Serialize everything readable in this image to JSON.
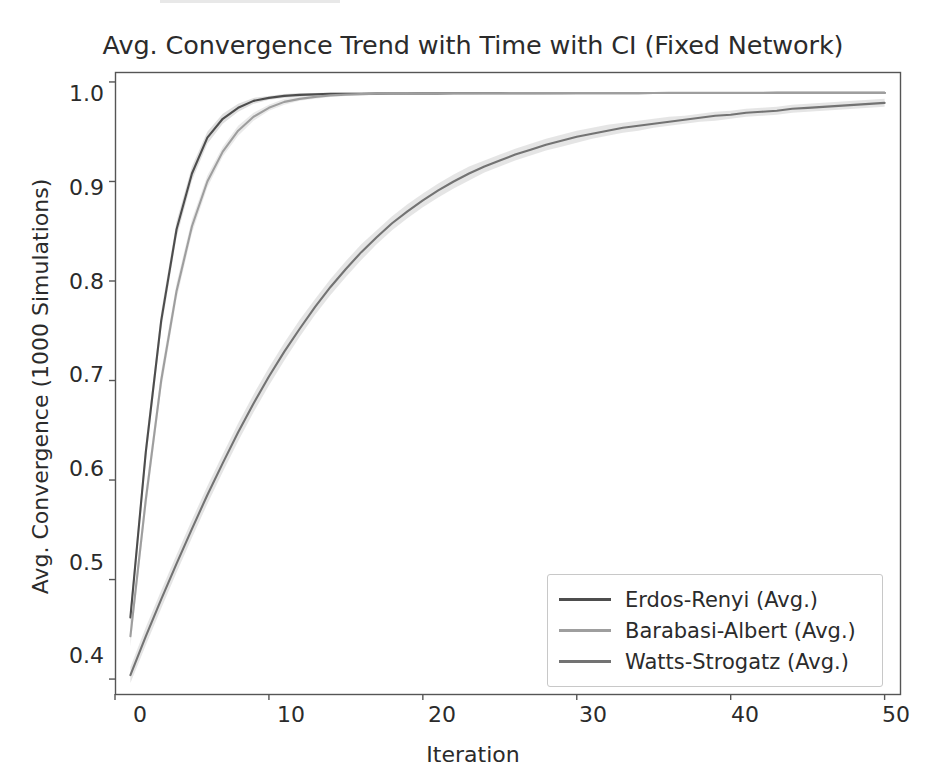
{
  "figure": {
    "background": "#ffffff",
    "width": 946,
    "height": 780
  },
  "chart_data": {
    "type": "line",
    "title": "Avg. Convergence Trend with Time with CI (Fixed Network)",
    "xlabel": "Iteration",
    "ylabel": "Avg. Convergence (1000 Simulations)",
    "xlim": [
      0,
      51
    ],
    "ylim": [
      0.385,
      1.01
    ],
    "grid": false,
    "legend_position": "lower right",
    "xticks": [
      0,
      10,
      20,
      30,
      40,
      50
    ],
    "xtick_labels": [
      "0",
      "10",
      "20",
      "30",
      "40",
      "50"
    ],
    "yticks": [
      0.4,
      0.5,
      0.6,
      0.7,
      0.8,
      0.9,
      1.0
    ],
    "ytick_labels": [
      "0.4",
      "0.5",
      "0.6",
      "0.7",
      "0.8",
      "0.9",
      "1.0"
    ],
    "x": [
      1,
      2,
      3,
      4,
      5,
      6,
      7,
      8,
      9,
      10,
      11,
      12,
      13,
      14,
      15,
      16,
      17,
      18,
      19,
      20,
      21,
      22,
      23,
      24,
      25,
      26,
      27,
      28,
      29,
      30,
      31,
      32,
      33,
      34,
      35,
      36,
      37,
      38,
      39,
      40,
      41,
      42,
      43,
      44,
      45,
      46,
      47,
      48,
      49,
      50
    ],
    "series": [
      {
        "name": "Erdos-Renyi (Avg.)",
        "color": "#4d4d4d",
        "ci_color": "#d9d9d9",
        "values": [
          0.462,
          0.628,
          0.76,
          0.852,
          0.908,
          0.944,
          0.963,
          0.974,
          0.981,
          0.984,
          0.986,
          0.987,
          0.9875,
          0.988,
          0.988,
          0.9882,
          0.9883,
          0.9884,
          0.9884,
          0.9885,
          0.9885,
          0.9886,
          0.9886,
          0.9886,
          0.9887,
          0.9887,
          0.9887,
          0.9887,
          0.9888,
          0.9888,
          0.9888,
          0.9888,
          0.9888,
          0.9888,
          0.9889,
          0.9889,
          0.9889,
          0.9889,
          0.9889,
          0.9889,
          0.9889,
          0.9889,
          0.989,
          0.989,
          0.989,
          0.989,
          0.989,
          0.989,
          0.989,
          0.989
        ],
        "ci_lower": [
          0.452,
          0.618,
          0.751,
          0.844,
          0.901,
          0.938,
          0.958,
          0.97,
          0.978,
          0.982,
          0.984,
          0.985,
          0.986,
          0.9865,
          0.9868,
          0.987,
          0.9871,
          0.9872,
          0.9873,
          0.9874,
          0.9874,
          0.9875,
          0.9875,
          0.9876,
          0.9876,
          0.9877,
          0.9877,
          0.9877,
          0.9878,
          0.9878,
          0.9878,
          0.9878,
          0.9879,
          0.9879,
          0.9879,
          0.9879,
          0.9879,
          0.988,
          0.988,
          0.988,
          0.988,
          0.988,
          0.988,
          0.988,
          0.988,
          0.988,
          0.988,
          0.988,
          0.988,
          0.988
        ],
        "ci_upper": [
          0.472,
          0.638,
          0.769,
          0.86,
          0.915,
          0.95,
          0.968,
          0.978,
          0.984,
          0.986,
          0.988,
          0.989,
          0.989,
          0.9895,
          0.9896,
          0.9897,
          0.9898,
          0.9898,
          0.9899,
          0.9899,
          0.99,
          0.99,
          0.99,
          0.99,
          0.99,
          0.99,
          0.99,
          0.99,
          0.99,
          0.99,
          0.99,
          0.99,
          0.99,
          0.99,
          0.99,
          0.99,
          0.99,
          0.99,
          0.99,
          0.99,
          0.99,
          0.99,
          0.99,
          0.99,
          0.99,
          0.99,
          0.99,
          0.99,
          0.99,
          0.99
        ]
      },
      {
        "name": "Barabasi-Albert (Avg.)",
        "color": "#9e9e9e",
        "ci_color": "#e6e6e6",
        "values": [
          0.443,
          0.58,
          0.7,
          0.79,
          0.855,
          0.9,
          0.93,
          0.951,
          0.965,
          0.974,
          0.98,
          0.983,
          0.985,
          0.9865,
          0.9873,
          0.9878,
          0.9881,
          0.9883,
          0.9884,
          0.9885,
          0.9886,
          0.9886,
          0.9887,
          0.9887,
          0.9887,
          0.9888,
          0.9888,
          0.9888,
          0.9888,
          0.9889,
          0.9889,
          0.9889,
          0.9889,
          0.9889,
          0.9889,
          0.989,
          0.989,
          0.989,
          0.989,
          0.989,
          0.989,
          0.989,
          0.989,
          0.989,
          0.989,
          0.989,
          0.989,
          0.989,
          0.989,
          0.989
        ],
        "ci_lower": [
          0.433,
          0.57,
          0.691,
          0.782,
          0.848,
          0.894,
          0.925,
          0.946,
          0.961,
          0.971,
          0.977,
          0.981,
          0.983,
          0.985,
          0.986,
          0.9865,
          0.9869,
          0.9871,
          0.9873,
          0.9874,
          0.9875,
          0.9875,
          0.9876,
          0.9876,
          0.9877,
          0.9877,
          0.9877,
          0.9878,
          0.9878,
          0.9878,
          0.9878,
          0.9879,
          0.9879,
          0.9879,
          0.9879,
          0.988,
          0.988,
          0.988,
          0.988,
          0.988,
          0.988,
          0.988,
          0.988,
          0.988,
          0.988,
          0.988,
          0.988,
          0.988,
          0.988,
          0.988
        ],
        "ci_upper": [
          0.453,
          0.59,
          0.709,
          0.798,
          0.862,
          0.906,
          0.935,
          0.956,
          0.969,
          0.977,
          0.983,
          0.985,
          0.987,
          0.988,
          0.9886,
          0.989,
          0.9893,
          0.9895,
          0.9896,
          0.9896,
          0.9897,
          0.9897,
          0.9898,
          0.9898,
          0.9898,
          0.9899,
          0.9899,
          0.9899,
          0.9899,
          0.99,
          0.99,
          0.99,
          0.99,
          0.99,
          0.99,
          0.99,
          0.99,
          0.99,
          0.99,
          0.99,
          0.99,
          0.99,
          0.99,
          0.99,
          0.99,
          0.99,
          0.99,
          0.99,
          0.99,
          0.99
        ]
      },
      {
        "name": "Watts-Strogatz (Avg.)",
        "color": "#737373",
        "ci_color": "#e0e0e0",
        "values": [
          0.404,
          0.443,
          0.48,
          0.516,
          0.551,
          0.585,
          0.617,
          0.648,
          0.677,
          0.704,
          0.729,
          0.752,
          0.774,
          0.794,
          0.812,
          0.829,
          0.844,
          0.858,
          0.87,
          0.881,
          0.891,
          0.9,
          0.908,
          0.915,
          0.921,
          0.927,
          0.932,
          0.937,
          0.941,
          0.945,
          0.948,
          0.951,
          0.954,
          0.956,
          0.958,
          0.96,
          0.962,
          0.964,
          0.966,
          0.967,
          0.969,
          0.97,
          0.971,
          0.973,
          0.974,
          0.975,
          0.976,
          0.977,
          0.978,
          0.979
        ],
        "ci_lower": [
          0.396,
          0.434,
          0.471,
          0.507,
          0.542,
          0.576,
          0.608,
          0.639,
          0.668,
          0.695,
          0.72,
          0.744,
          0.766,
          0.786,
          0.804,
          0.821,
          0.837,
          0.851,
          0.863,
          0.874,
          0.884,
          0.893,
          0.901,
          0.909,
          0.915,
          0.921,
          0.926,
          0.931,
          0.935,
          0.939,
          0.943,
          0.946,
          0.949,
          0.951,
          0.954,
          0.956,
          0.958,
          0.96,
          0.961,
          0.963,
          0.965,
          0.966,
          0.967,
          0.969,
          0.97,
          0.971,
          0.972,
          0.973,
          0.974,
          0.975
        ],
        "ci_upper": [
          0.412,
          0.452,
          0.489,
          0.525,
          0.56,
          0.594,
          0.626,
          0.657,
          0.686,
          0.713,
          0.738,
          0.761,
          0.782,
          0.802,
          0.82,
          0.837,
          0.851,
          0.865,
          0.877,
          0.888,
          0.898,
          0.907,
          0.915,
          0.921,
          0.927,
          0.933,
          0.938,
          0.943,
          0.947,
          0.951,
          0.954,
          0.957,
          0.959,
          0.961,
          0.963,
          0.965,
          0.966,
          0.968,
          0.97,
          0.971,
          0.973,
          0.974,
          0.975,
          0.977,
          0.978,
          0.979,
          0.98,
          0.981,
          0.982,
          0.983
        ]
      }
    ]
  },
  "axes_style": {
    "spine_color": "#555555",
    "tick_color": "#555555",
    "legend_border": "#c8c8c8"
  }
}
